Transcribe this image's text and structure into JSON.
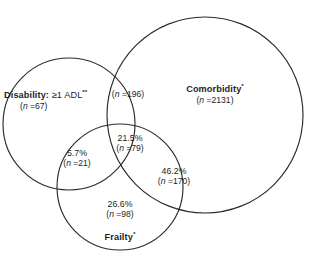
{
  "figure": {
    "type": "venn-diagram",
    "set_count": 3,
    "stroke_color": "#2b2b2b",
    "background_color": "#ffffff",
    "text_color": "#231f20"
  },
  "sets": {
    "disability": {
      "name_bold": "Disability:",
      "name_rest": "≥1 ADL",
      "superscript": "**",
      "count_label": "(n =67)",
      "count_prefix": "(",
      "count_italic_n": "n",
      "count_value": " =67)",
      "geometry": {
        "cx": 69,
        "cy": 124,
        "r": 66
      }
    },
    "comorbidity": {
      "name_bold": "Comorbidity",
      "superscript": "*",
      "count_label": "(n =2131)",
      "count_italic_n": "n",
      "count_value": " =2131)",
      "geometry": {
        "cx": 205,
        "cy": 115,
        "r": 98
      }
    },
    "frailty": {
      "name_bold": "Frailty",
      "superscript": "*",
      "geometry": {
        "cx": 120,
        "cy": 187,
        "r": 63
      }
    }
  },
  "regions": [
    {
      "id": "disability-comorbidity",
      "percent": "",
      "count_italic_n": "n",
      "count_value": " =196)",
      "count_label": "(n =196)"
    },
    {
      "id": "triple-intersection",
      "percent": "21.5%",
      "count_italic_n": "n",
      "count_value": " =79)",
      "count_label": "(n =79)"
    },
    {
      "id": "disability-frailty",
      "percent": "5.7%",
      "count_italic_n": "n",
      "count_value": " =21)",
      "count_label": "(n =21)"
    },
    {
      "id": "frailty-comorbidity",
      "percent": "46.2%",
      "count_italic_n": "n",
      "count_value": " =170)",
      "count_label": "(n =170)"
    },
    {
      "id": "frailty-only",
      "percent": "26.6%",
      "count_italic_n": "n",
      "count_value": " =98)",
      "count_label": "(n =98)"
    }
  ]
}
